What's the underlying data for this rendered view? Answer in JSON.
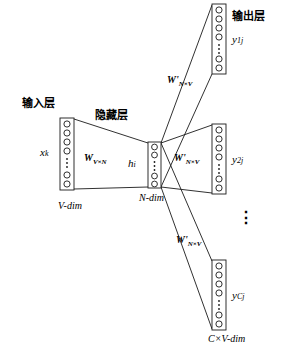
{
  "diagram": {
    "labels": {
      "input_layer_cn": "输入层",
      "hidden_layer_cn": "隐藏层",
      "output_layer_cn": "输出层",
      "input_vector": "x",
      "input_vector_sub": "k",
      "hidden_vector": "h",
      "hidden_vector_sub": "i",
      "output_1": "y",
      "output_1_sub": "1j",
      "output_2": "y",
      "output_2_sub": "2j",
      "output_3": "y",
      "output_3_sub": "Cj",
      "weight_input": "W",
      "weight_input_sub": "V×N",
      "weight_out_1": "W'",
      "weight_out_1_sub": "N×V",
      "weight_out_2": "W'",
      "weight_out_2_sub": "N×V",
      "weight_out_3": "W'",
      "weight_out_3_sub": "N×V",
      "input_dim": "V-dim",
      "hidden_dim": "N-dim",
      "output_dim": "C×V-dim",
      "ellipsis_vertical": "⋮"
    },
    "colors": {
      "stroke": "#1a1a1a",
      "background": "#ffffff",
      "node_fill": "#ffffff"
    },
    "layers": {
      "input": {
        "nodes": 7,
        "x": 60,
        "y": 118,
        "width": 14,
        "height": 72
      },
      "hidden": {
        "nodes": 5,
        "x": 148,
        "y": 142,
        "width": 13,
        "height": 46
      },
      "output_top": {
        "nodes": 7,
        "x": 212,
        "y": 4,
        "width": 14,
        "height": 70
      },
      "output_mid": {
        "nodes": 7,
        "x": 212,
        "y": 124,
        "width": 14,
        "height": 70
      },
      "output_bottom": {
        "nodes": 7,
        "x": 212,
        "y": 260,
        "width": 14,
        "height": 70
      }
    }
  }
}
